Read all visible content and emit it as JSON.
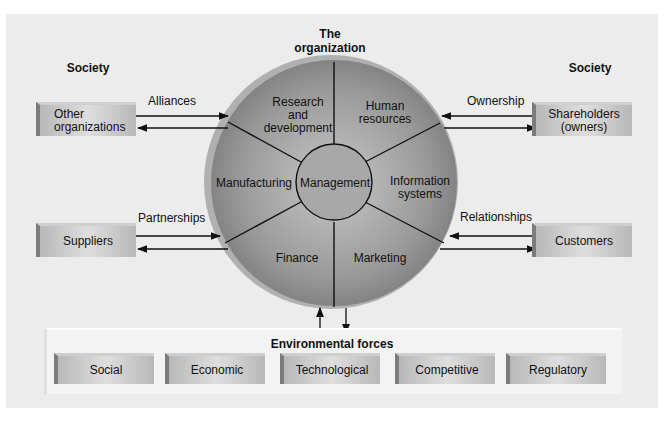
{
  "society_left": "Society",
  "society_right": "Society",
  "organization": {
    "center": "Management",
    "segments": [
      {
        "label_lines": [
          "Research",
          "and",
          "development"
        ]
      },
      {
        "label_lines": [
          "Human",
          "resources"
        ]
      },
      {
        "label_lines": [
          "Information",
          "systems"
        ]
      },
      {
        "label_lines": [
          "Marketing"
        ]
      },
      {
        "label_lines": [
          "Finance"
        ]
      },
      {
        "label_lines": [
          "Manufacturing"
        ]
      }
    ]
  },
  "external": {
    "other_orgs": {
      "line1": "Other",
      "line2": "organizations",
      "relation": "Alliances"
    },
    "shareholders": {
      "line1": "Shareholders",
      "line2": "(owners)",
      "relation": "Ownership"
    },
    "suppliers": {
      "label": "Suppliers",
      "relation": "Partnerships"
    },
    "customers": {
      "label": "Customers",
      "relation": "Relationships"
    }
  },
  "environmental": {
    "title": "Environmental forces",
    "forces": [
      "Social",
      "Economic",
      "Technological",
      "Competitive",
      "Regulatory"
    ]
  }
}
